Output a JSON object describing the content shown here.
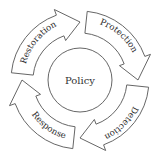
{
  "diagram": {
    "type": "cycle",
    "direction": "clockwise",
    "center_label": "Policy",
    "stages": [
      {
        "label": "Protection",
        "position": "top-right"
      },
      {
        "label": "Detection",
        "position": "bottom-right"
      },
      {
        "label": "Response",
        "position": "bottom-left"
      },
      {
        "label": "Restoration",
        "position": "top-left"
      }
    ],
    "colors": {
      "stroke": "#555555",
      "fill": "#ffffff",
      "text": "#2a2a2a"
    }
  }
}
